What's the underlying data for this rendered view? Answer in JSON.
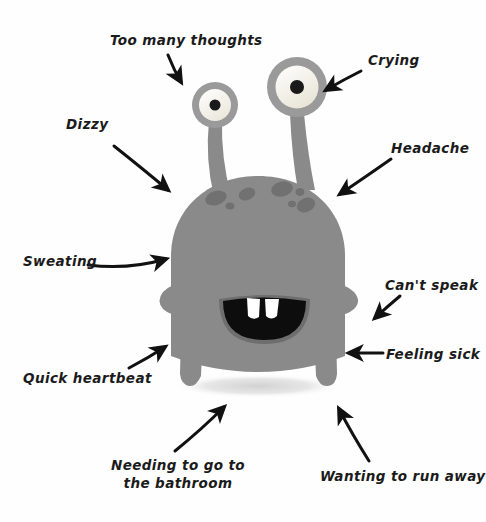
{
  "figure": {
    "background_color": "#fefefe",
    "body_color": "#8a8a8a",
    "body_shade_color": "#7d7d7d",
    "spot_color": "#6f6f6f",
    "eye_ring_color": "#9a9a9a",
    "eye_white_color": "#f7f5ef",
    "pupil_color": "#1a1a1a",
    "mouth_color": "#0d0d0d",
    "tooth_color": "#ffffff",
    "shadow_color": "#d9d9d9",
    "arrow_color": "#111111",
    "label_color": "#1b1b1b"
  },
  "labels": [
    {
      "id": "too-many-thoughts",
      "text": "Too many thoughts",
      "x": 110,
      "y": 32,
      "align": "left"
    },
    {
      "id": "crying",
      "text": "Crying",
      "x": 368,
      "y": 52,
      "align": "left"
    },
    {
      "id": "dizzy",
      "text": "Dizzy",
      "x": 66,
      "y": 116,
      "align": "left"
    },
    {
      "id": "headache",
      "text": "Headache",
      "x": 391,
      "y": 140,
      "align": "left"
    },
    {
      "id": "sweating",
      "text": "Sweating",
      "x": 23,
      "y": 253,
      "align": "left"
    },
    {
      "id": "cant-speak",
      "text": "Can't speak",
      "x": 385,
      "y": 277,
      "align": "left"
    },
    {
      "id": "feeling-sick",
      "text": "Feeling sick",
      "x": 386,
      "y": 346,
      "align": "left"
    },
    {
      "id": "quick-heartbeat",
      "text": "Quick heartbeat",
      "x": 23,
      "y": 370,
      "align": "left"
    },
    {
      "id": "wanting-to-run-away",
      "text": "Wanting to run away",
      "x": 320,
      "y": 468,
      "align": "left"
    }
  ],
  "multiline_labels": [
    {
      "id": "needing-bathroom",
      "line1": "Needing to go to",
      "line2": "the bathroom",
      "x": 108,
      "y": 456,
      "width": 140
    }
  ],
  "arrows": [
    {
      "id": "arrow-too-many-thoughts",
      "from": [
        168,
        55
      ],
      "to": [
        182,
        84
      ]
    },
    {
      "id": "arrow-crying",
      "from": [
        360,
        72
      ],
      "to": [
        323,
        92
      ]
    },
    {
      "id": "arrow-dizzy",
      "from": [
        113,
        145
      ],
      "to": [
        170,
        192
      ]
    },
    {
      "id": "arrow-headache",
      "from": [
        392,
        158
      ],
      "to": [
        337,
        196
      ]
    },
    {
      "id": "arrow-sweating",
      "from": [
        90,
        265
      ],
      "to": [
        170,
        258
      ]
    },
    {
      "id": "arrow-cant-speak",
      "from": [
        400,
        295
      ],
      "to": [
        372,
        320
      ]
    },
    {
      "id": "arrow-feeling-sick",
      "from": [
        384,
        353
      ],
      "to": [
        345,
        353
      ]
    },
    {
      "id": "arrow-quick-heartbeat",
      "from": [
        128,
        367
      ],
      "to": [
        168,
        345
      ]
    },
    {
      "id": "arrow-needing-bathroom",
      "from": [
        176,
        450
      ],
      "to": [
        226,
        404
      ]
    },
    {
      "id": "arrow-wanting-to-run-away",
      "from": [
        368,
        460
      ],
      "to": [
        338,
        406
      ]
    }
  ],
  "monster": {
    "name": "anxiety-monster",
    "left_eye": {
      "cx": 215,
      "cy": 105,
      "r_outer": 23,
      "r_white": 16,
      "r_pupil": 5.5
    },
    "right_eye": {
      "cx": 297,
      "cy": 87,
      "r_outer": 30,
      "r_white": 21.5,
      "r_pupil": 7
    },
    "mouth": {
      "cx": 264,
      "cy": 300,
      "rx": 46,
      "ry": 42
    },
    "teeth_count": 2,
    "spots_count": 7,
    "legs_count": 2,
    "arms_count": 2
  }
}
